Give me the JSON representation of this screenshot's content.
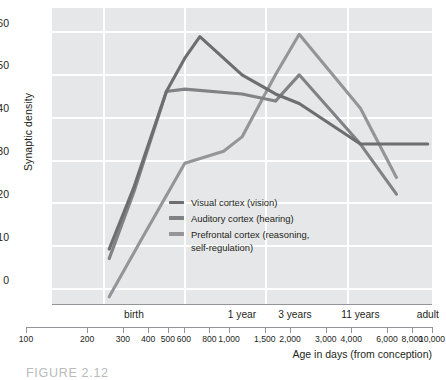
{
  "figure": {
    "caption": "FIGURE 2.12"
  },
  "chart_data": {
    "type": "line",
    "title": "",
    "xlabel": "Age in days (from conception)",
    "ylabel": "Synaptic density",
    "xscale": "log",
    "xlim": [
      100,
      10000
    ],
    "ylim": [
      0,
      62
    ],
    "yticks": [
      0,
      10,
      20,
      30,
      40,
      50,
      60
    ],
    "grid": "white gridlines, horizontal and vertical",
    "legend_position": "inside lower-left-center",
    "plot_background": "#e6e7e8",
    "x_numeric_ticks": [
      100,
      200,
      300,
      400,
      500,
      600,
      800,
      1000,
      1500,
      2000,
      3000,
      4000,
      6000,
      8000,
      10000
    ],
    "x_numeric_tick_labels": [
      "100",
      "200",
      "300",
      "400",
      "500",
      "600",
      "800",
      "1,000",
      "1,500",
      "2,000",
      "3,000",
      "4,000",
      "6,000",
      "8,000",
      "10,000"
    ],
    "x_stage_ticks": [
      270,
      1000,
      1900,
      4200,
      9500
    ],
    "x_stage_labels": [
      "birth",
      "1 year",
      "3 years",
      "11 years",
      "adult"
    ],
    "series": [
      {
        "name": "Visual cortex (vision)",
        "legend_label": "Visual cortex (vision)",
        "color": "#6d6e70",
        "x": [
          200,
          270,
          400,
          500,
          600,
          1000,
          1500,
          2000,
          4200,
          9500
        ],
        "values": [
          11.5,
          24.5,
          44.5,
          51.5,
          56.0,
          48.0,
          44.0,
          42.0,
          33.5,
          33.5
        ]
      },
      {
        "name": "Auditory cortex (hearing)",
        "legend_label": "Auditory cortex (hearing)",
        "color": "#808285",
        "x": [
          200,
          270,
          400,
          500,
          1000,
          1500,
          2000,
          4200,
          6500
        ],
        "values": [
          9.5,
          23.5,
          44.5,
          45.0,
          44.0,
          42.5,
          48.0,
          33.5,
          23.0
        ]
      },
      {
        "name": "Prefrontal cortex (reasoning, self-regulation)",
        "legend_label": "Prefrontal cortex (reasoning,\nself-regulation)",
        "color": "#939598",
        "x": [
          200,
          300,
          500,
          800,
          1000,
          1500,
          2000,
          4200,
          6500
        ],
        "values": [
          1.5,
          14.0,
          29.5,
          32.0,
          35.0,
          48.0,
          56.5,
          41.0,
          26.5
        ]
      }
    ]
  }
}
